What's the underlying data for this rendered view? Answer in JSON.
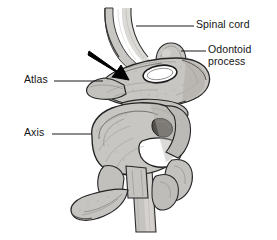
{
  "figure": {
    "background_color": "#ffffff",
    "bone_fill_color": "#c8c6c2",
    "bone_shade_color": "#9b9894",
    "outline_color": "#2b2b2b",
    "cord_fill_color": "#c9c7c3",
    "arrow_color": "#000000",
    "foramen_color": "#4a4744",
    "label_color": "#141414"
  },
  "labels": [
    {
      "id": "spinal-cord",
      "text": "Spinal cord",
      "side": "right",
      "x": 196,
      "y": 19,
      "leader": {
        "x1": 136,
        "y1": 26,
        "x2": 194,
        "y2": 26
      }
    },
    {
      "id": "odontoid-process",
      "text": "Odontoid process",
      "line1": "Odontoid",
      "line2": "process",
      "side": "right",
      "x": 208,
      "y": 44,
      "leader": {
        "x1": 181,
        "y1": 51,
        "x2": 206,
        "y2": 51
      }
    },
    {
      "id": "atlas",
      "text": "Atlas",
      "side": "left",
      "x": 24,
      "y": 74,
      "leader": {
        "x1": 54,
        "y1": 81,
        "x2": 103,
        "y2": 81
      }
    },
    {
      "id": "axis",
      "text": "Axis",
      "side": "left",
      "x": 24,
      "y": 127,
      "leader": {
        "x1": 52,
        "y1": 134,
        "x2": 92,
        "y2": 134
      }
    }
  ],
  "annotations": [
    {
      "id": "pointer-arrow",
      "type": "arrow",
      "description": "black arrow pointing down-right at the atlanto-axial junction",
      "tail": {
        "x": 90,
        "y": 52
      },
      "tip": {
        "x": 127,
        "y": 78
      },
      "color": "#000000"
    }
  ],
  "structures": [
    {
      "id": "spinal-cord-upper",
      "name": "spinal cord (upper segment)"
    },
    {
      "id": "spinal-cord-lower",
      "name": "spinal cord (lower segment)"
    },
    {
      "id": "odontoid-process",
      "name": "odontoid process (dens)"
    },
    {
      "id": "atlas",
      "name": "atlas (C1 vertebra)"
    },
    {
      "id": "axis",
      "name": "axis (C2 vertebra)"
    },
    {
      "id": "transverse-foramen",
      "name": "transverse foramen"
    },
    {
      "id": "vertebral-foramen",
      "name": "vertebral foramen"
    },
    {
      "id": "spinous-process",
      "name": "spinous process of axis"
    }
  ]
}
